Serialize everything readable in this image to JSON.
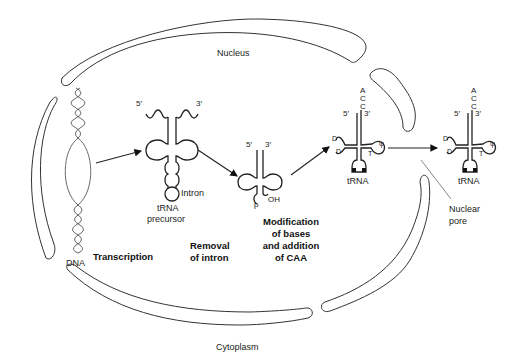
{
  "diagram": {
    "regions": {
      "nucleus": "Nucleus",
      "cytoplasm": "Cytoplasm"
    },
    "structures": {
      "dna": "DNA",
      "trna_precursor_line1": "tRNA",
      "trna_precursor_line2": "precursor",
      "intron": "Intron",
      "trna_mature_nucleus": "tRNA",
      "trna_cytoplasm": "tRNA",
      "nuclear_pore_line1": "Nuclear",
      "nuclear_pore_line2": "pore"
    },
    "ends": {
      "five_prime": "5′",
      "three_prime": "3′",
      "oh": "OH",
      "p": "p"
    },
    "cca_tail": [
      "A",
      "C",
      "C"
    ],
    "modified_bases": {
      "d": "D",
      "t": "T",
      "psi": "ψ"
    },
    "steps": {
      "transcription": "Transcription",
      "removal_line1": "Removal",
      "removal_line2": "of intron",
      "modification_line1": "Modification",
      "modification_line2": "of bases",
      "modification_line3": "and addition",
      "modification_line4": "of CAA"
    },
    "colors": {
      "line": "#222222",
      "background": "#ffffff"
    }
  }
}
